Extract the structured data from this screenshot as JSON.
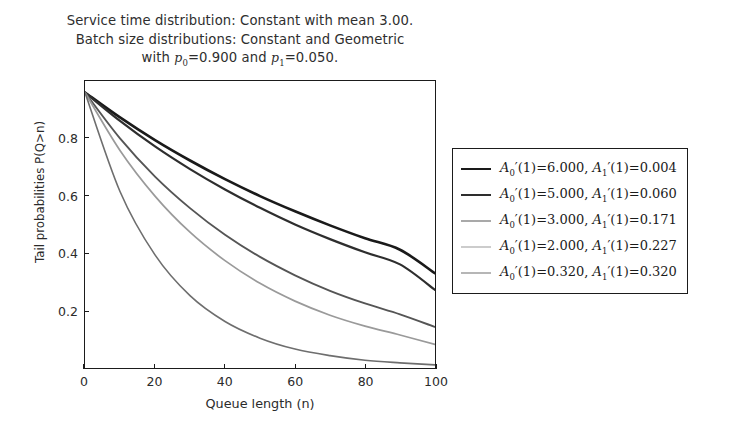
{
  "chart_data": {
    "type": "line",
    "title_lines": [
      "Service time distribution: Constant with mean 3.00.",
      "Batch size distributions: Constant and Geometric",
      "with p0=0.900 and p1=0.050."
    ],
    "title": "Service time distribution: Constant with mean 3.00. Batch size distributions: Constant and Geometric with p0=0.900 and p1=0.050.",
    "service_time_mean": "3.00",
    "p0": "0.900",
    "p1": "0.050",
    "xlabel": "Queue length (n)",
    "ylabel": "Tail probabilities P(Q>n)",
    "xlim": [
      0,
      100
    ],
    "ylim": [
      0,
      1
    ],
    "xticks": [
      "0",
      "20",
      "40",
      "60",
      "80",
      "100"
    ],
    "xtick_values": [
      0,
      20,
      40,
      60,
      80,
      100
    ],
    "yticks": [
      "0.2",
      "0.4",
      "0.6",
      "0.8"
    ],
    "ytick_values": [
      0.2,
      0.4,
      0.6,
      0.8
    ],
    "grid": false,
    "legend_position": "right-outside",
    "x": [
      0,
      10,
      20,
      30,
      40,
      50,
      60,
      70,
      80,
      90,
      100
    ],
    "series": [
      {
        "name": "A0'(1)=6.000, A1'(1)=0.004",
        "a0": "6.000",
        "a1": "0.004",
        "color": "#1a1a1a",
        "width": 2.6,
        "values": [
          0.96,
          0.873,
          0.794,
          0.723,
          0.658,
          0.599,
          0.546,
          0.497,
          0.452,
          0.412,
          0.33
        ]
      },
      {
        "name": "A0'(1)=5.000, A1'(1)=0.060",
        "a0": "5.000",
        "a1": "0.060",
        "color": "#2e2e2e",
        "width": 2.2,
        "values": [
          0.96,
          0.861,
          0.772,
          0.693,
          0.622,
          0.558,
          0.5,
          0.449,
          0.403,
          0.361,
          0.272
        ]
      },
      {
        "name": "A0'(1)=3.000, A1'(1)=0.171",
        "a0": "3.000",
        "a1": "0.171",
        "color": "#555555",
        "width": 1.9,
        "values": [
          0.96,
          0.8,
          0.667,
          0.557,
          0.464,
          0.387,
          0.323,
          0.269,
          0.225,
          0.187,
          0.143
        ]
      },
      {
        "name": "A0'(1)=2.000, A1'(1)=0.227",
        "a0": "2.000",
        "a1": "0.227",
        "color": "#9a9a9a",
        "width": 1.7,
        "values": [
          0.96,
          0.758,
          0.599,
          0.473,
          0.374,
          0.295,
          0.233,
          0.184,
          0.146,
          0.115,
          0.082
        ]
      },
      {
        "name": "A0'(1)=0.320, A1'(1)=0.320",
        "a0": "0.320",
        "a1": "0.320",
        "color": "#6e6e6e",
        "width": 1.6,
        "values": [
          0.96,
          0.615,
          0.394,
          0.252,
          0.162,
          0.104,
          0.066,
          0.043,
          0.027,
          0.018,
          0.011
        ]
      }
    ]
  },
  "legend": {
    "entries": [
      {
        "label": "A₀′(1)=6.000, A₁′(1)=0.004"
      },
      {
        "label": "A₀′(1)=5.000, A₁′(1)=0.060"
      },
      {
        "label": "A₀′(1)=3.000, A₁′(1)=0.171"
      },
      {
        "label": "A₀′(1)=2.000, A₁′(1)=0.227"
      },
      {
        "label": "A₀′(1)=0.320, A₁′(1)=0.320"
      }
    ]
  }
}
